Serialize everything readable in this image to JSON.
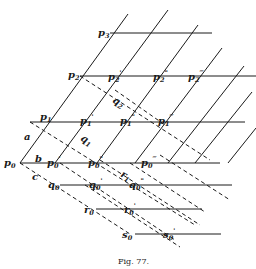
{
  "figure": {
    "caption": "Fig. 77."
  },
  "labels": {
    "p3": {
      "base": "p",
      "sub": "3",
      "sup": ""
    },
    "p2": {
      "base": "p",
      "sub": "2",
      "sup": ""
    },
    "p2p": {
      "base": "p",
      "sub": "2",
      "sup": "'"
    },
    "p2pp": {
      "base": "p",
      "sub": "2",
      "sup": "\""
    },
    "p2ppp": {
      "base": "p",
      "sub": "2",
      "sup": "‴"
    },
    "p1": {
      "base": "p",
      "sub": "1",
      "sup": ""
    },
    "p1p": {
      "base": "p",
      "sub": "1",
      "sup": "'"
    },
    "p1pp": {
      "base": "p",
      "sub": "1",
      "sup": "\""
    },
    "p1ppp": {
      "base": "p",
      "sub": "1",
      "sup": "‴"
    },
    "p0": {
      "base": "p",
      "sub": "0",
      "sup": ""
    },
    "p0p": {
      "base": "p",
      "sub": "0",
      "sup": "'"
    },
    "p0pp": {
      "base": "p",
      "sub": "0",
      "sup": "\""
    },
    "p0ppp": {
      "base": "p",
      "sub": "0",
      "sup": "‴"
    },
    "q2": {
      "base": "q",
      "sub": "2",
      "sup": ""
    },
    "q1": {
      "base": "q",
      "sub": "1",
      "sup": ""
    },
    "q0": {
      "base": "q",
      "sub": "0",
      "sup": ""
    },
    "q0p": {
      "base": "q",
      "sub": "0",
      "sup": "'"
    },
    "q0pp": {
      "base": "q",
      "sub": "0",
      "sup": "\""
    },
    "r1": {
      "base": "r",
      "sub": "1",
      "sup": ""
    },
    "r0": {
      "base": "r",
      "sub": "0",
      "sup": ""
    },
    "r0p": {
      "base": "r",
      "sub": "0",
      "sup": "'"
    },
    "s0": {
      "base": "s",
      "sub": "0",
      "sup": ""
    },
    "s0p": {
      "base": "s",
      "sub": "0",
      "sup": "'"
    },
    "a": {
      "base": "a",
      "sub": "",
      "sup": ""
    },
    "b": {
      "base": "b",
      "sub": "",
      "sup": ""
    },
    "c": {
      "base": "c",
      "sub": "",
      "sup": ""
    }
  }
}
